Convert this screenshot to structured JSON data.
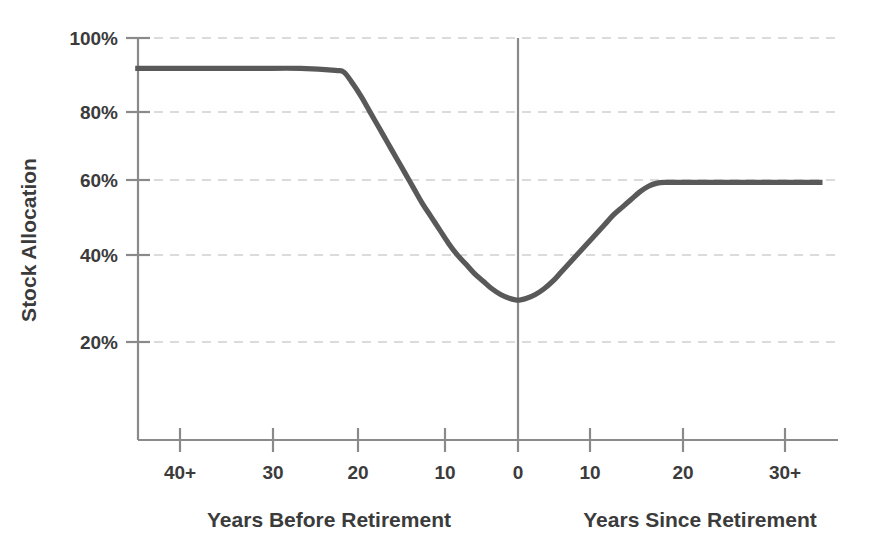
{
  "chart_data": {
    "type": "line",
    "title": "",
    "subtitle": "",
    "xlabel_left": "Years Before Retirement",
    "xlabel_right": "Years Since Retirement",
    "ylabel": "Stock Allocation",
    "ylim": [
      0,
      100
    ],
    "y_ticks": [
      20,
      40,
      60,
      80,
      100
    ],
    "y_ticklabels": [
      "20%",
      "40%",
      "60%",
      "80%",
      "100%"
    ],
    "x_ticklabels": [
      "40+",
      "30",
      "20",
      "10",
      "0",
      "10",
      "20",
      "30+"
    ],
    "x_tick_values": [
      -40,
      -30,
      -20,
      -10,
      0,
      10,
      20,
      30
    ],
    "xlim": [
      -44,
      35
    ],
    "grid": "horizontal-dashed",
    "legend": "none",
    "zero_marker_label": "0",
    "series": [
      {
        "name": "Stock Allocation Glidepath",
        "color": "#595959",
        "line_width_px": 5,
        "x": [
          -44,
          -40,
          -35,
          -30,
          -25,
          -21,
          -20,
          -19,
          -18,
          -17,
          -16,
          -15,
          -14,
          -13,
          -12,
          -11,
          -10,
          -9,
          -8,
          -7,
          -6,
          -5,
          -4,
          -3,
          -2,
          -1,
          0,
          1,
          2,
          3,
          4,
          5,
          6,
          7,
          8,
          9,
          10,
          11,
          12,
          13,
          14,
          15,
          16,
          17,
          18,
          20,
          25,
          30,
          35
        ],
        "y": [
          92,
          92,
          92,
          92,
          92,
          91.5,
          91,
          88,
          84.5,
          80.5,
          76.5,
          72.5,
          68.5,
          64.5,
          60.5,
          56.5,
          53,
          49.5,
          46,
          43,
          40.5,
          38,
          36,
          34,
          32.5,
          31.5,
          31,
          31.5,
          32.5,
          34,
          36,
          38.5,
          41,
          43.5,
          46,
          48.5,
          51,
          53.5,
          55.5,
          57.5,
          59.5,
          61,
          61.8,
          62,
          62,
          62,
          62,
          62,
          62
        ]
      }
    ],
    "annotations": {
      "left_plateau_value_pct": 92,
      "minimum_value_pct": 31,
      "right_plateau_value_pct": 62,
      "minimum_at_years": 0
    },
    "colors": {
      "series": "#595959",
      "axis": "#8a8a8a",
      "gridline": "#cfcfcf",
      "text": "#3b3b3b",
      "background": "#ffffff"
    }
  }
}
